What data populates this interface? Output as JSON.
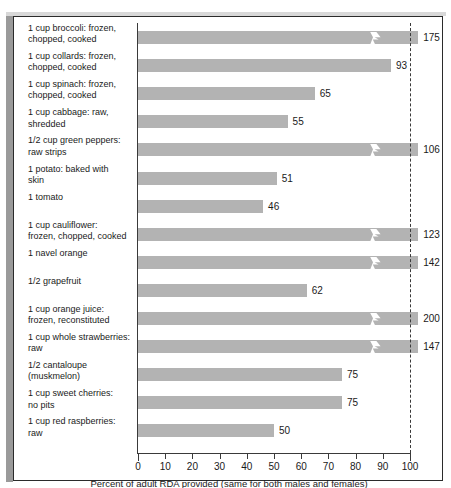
{
  "chart_data": {
    "type": "bar",
    "orientation": "horizontal",
    "title": "",
    "xlabel": "Percent of adult RDA provided (same for both males and females)",
    "ylabel": "",
    "xlim": [
      0,
      100
    ],
    "xticks": [
      0,
      10,
      20,
      30,
      40,
      50,
      60,
      70,
      80,
      90,
      100
    ],
    "xtick_labels": [
      "0",
      "10",
      "20",
      "30",
      "40",
      "50",
      "60",
      "70",
      "80",
      "90",
      "100"
    ],
    "grid": false,
    "legend": null,
    "reference_line": {
      "value": 100,
      "style": "dashed"
    },
    "axis_break_note": "Bars exceeding 100% are drawn with a lightning-bolt break symbol",
    "categories": [
      "1 cup broccoli:  frozen,\nchopped, cooked",
      "1 cup collards:  frozen,\nchopped, cooked",
      "1 cup spinach:  frozen,\nchopped, cooked",
      "1 cup cabbage:  raw,\nshredded",
      "1/2 cup green peppers:\nraw strips",
      "1 potato:  baked with\nskin",
      "1 tomato",
      "1 cup cauliflower:\nfrozen, chopped, cooked",
      "1 navel orange",
      "1/2 grapefruit",
      "1 cup orange juice:\nfrozen, reconstituted",
      "1 cup whole strawberries:\nraw",
      "1/2 cantaloupe\n(muskmelon)",
      "1 cup sweet cherries:\nno pits",
      "1 cup red raspberries:\nraw"
    ],
    "values": [
      175,
      93,
      65,
      55,
      106,
      51,
      46,
      123,
      142,
      62,
      200,
      147,
      75,
      75,
      50
    ],
    "value_labels": [
      "175",
      "93",
      "65",
      "55",
      "106",
      "51",
      "46",
      "123",
      "142",
      "62",
      "200",
      "147",
      "75",
      "75",
      "50"
    ],
    "broken": [
      true,
      false,
      false,
      false,
      true,
      false,
      false,
      true,
      true,
      false,
      true,
      true,
      false,
      false,
      false
    ],
    "colors": {
      "bar": "#b3b3b3",
      "axis": "#3a3a3a",
      "text": "#1a1a1a",
      "background": "#ffffff",
      "frame": "#2b2b2b"
    }
  }
}
